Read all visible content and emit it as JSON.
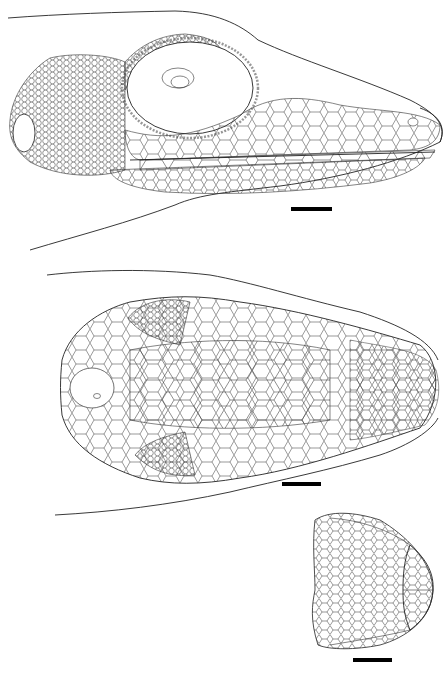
{
  "figure": {
    "panels": [
      {
        "id": "lateral",
        "view": "lateral view of head",
        "scale_bar": {
          "x": 291,
          "y": 207,
          "w": 41,
          "h": 4
        }
      },
      {
        "id": "dorsal",
        "view": "dorsal view of head",
        "scale_bar": {
          "x": 282,
          "y": 482,
          "w": 39,
          "h": 4
        }
      },
      {
        "id": "ventral",
        "view": "ventral view of chin",
        "scale_bar": {
          "x": 353,
          "y": 658,
          "w": 39,
          "h": 4
        }
      }
    ],
    "colors": {
      "line": "#222222",
      "background": "#ffffff",
      "scale_bar": "#000000"
    }
  }
}
